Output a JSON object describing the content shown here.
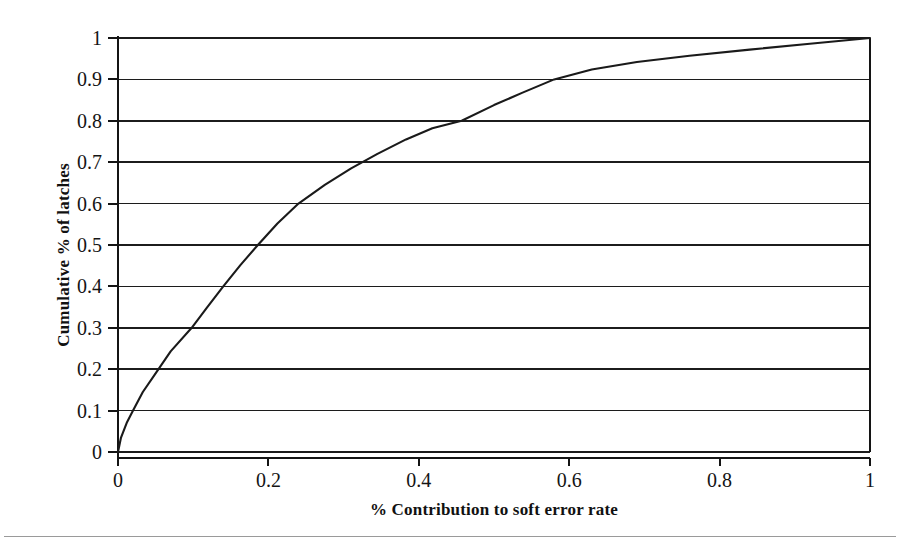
{
  "chart_data": {
    "type": "line",
    "title": "",
    "xlabel": "% Contribution to soft error rate",
    "ylabel": "Cumulative % of latches",
    "xlim": [
      0,
      1
    ],
    "ylim": [
      0,
      1
    ],
    "grid": "horizontal",
    "legend": "none",
    "xticks": [
      "0",
      "0.2",
      "0.4",
      "0.6",
      "0.8",
      "1"
    ],
    "xtick_values": [
      0,
      0.2,
      0.4,
      0.6,
      0.8,
      1
    ],
    "yticks": [
      "0",
      "0.1",
      "0.2",
      "0.3",
      "0.4",
      "0.5",
      "0.6",
      "0.7",
      "0.8",
      "0.9",
      "1"
    ],
    "ytick_values": [
      0,
      0.1,
      0.2,
      0.3,
      0.4,
      0.5,
      0.6,
      0.7,
      0.8,
      0.9,
      1
    ],
    "series": [
      {
        "name": "Cumulative distribution",
        "color": "#1a1a1a",
        "x": [
          0,
          0.004,
          0.012,
          0.02,
          0.033,
          0.05,
          0.07,
          0.098,
          0.118,
          0.14,
          0.163,
          0.186,
          0.212,
          0.24,
          0.275,
          0.31,
          0.345,
          0.383,
          0.418,
          0.457,
          0.5,
          0.538,
          0.58,
          0.63,
          0.69,
          0.76,
          0.84,
          0.92,
          1
        ],
        "y": [
          0,
          0.035,
          0.072,
          0.1,
          0.145,
          0.19,
          0.243,
          0.3,
          0.348,
          0.4,
          0.452,
          0.5,
          0.552,
          0.6,
          0.645,
          0.685,
          0.72,
          0.755,
          0.782,
          0.8,
          0.838,
          0.868,
          0.9,
          0.924,
          0.942,
          0.957,
          0.972,
          0.986,
          1
        ]
      }
    ],
    "annotations": []
  },
  "axes": {
    "x_title": "% Contribution to soft error rate",
    "y_title": "Cumulative % of latches"
  }
}
